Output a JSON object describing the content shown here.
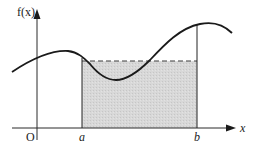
{
  "diagram": {
    "y_axis_label": "f(x)",
    "x_axis_label": "x",
    "origin_label": "O",
    "lower_bound_label": "a",
    "upper_bound_label": "b",
    "colors": {
      "curve": "#1a1a1a",
      "axes": "#2a2a2a",
      "shaded_region": "#d6d6d6",
      "dashed_line": "#3a3a3a",
      "background": "#ffffff"
    },
    "elements": [
      {
        "name": "curve",
        "description": "smooth curve f(x) with local max left of a, local min between a and b, local max near b"
      },
      {
        "name": "shaded-rectangle",
        "description": "rectangle from a to b with height equal to mean value of f on [a,b]"
      },
      {
        "name": "mean-value-dashed-line",
        "description": "horizontal dashed line at the mean value height"
      },
      {
        "name": "vertical-line-a",
        "description": "vertical line at x = a"
      },
      {
        "name": "vertical-line-b",
        "description": "vertical line at x = b up to the curve"
      }
    ]
  }
}
